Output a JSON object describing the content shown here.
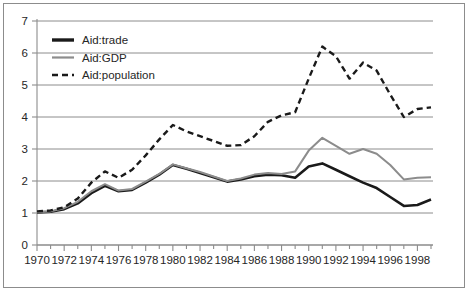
{
  "chart_data": {
    "type": "line",
    "title": "",
    "xlabel": "",
    "ylabel": "",
    "xlim": [
      1970,
      1999
    ],
    "ylim": [
      0,
      7
    ],
    "grid": true,
    "legend_position": "top-left",
    "x": [
      1970,
      1971,
      1972,
      1973,
      1974,
      1975,
      1976,
      1977,
      1978,
      1979,
      1980,
      1981,
      1982,
      1983,
      1984,
      1985,
      1986,
      1987,
      1988,
      1989,
      1990,
      1991,
      1992,
      1993,
      1994,
      1995,
      1996,
      1997,
      1998,
      1999
    ],
    "xtick_labels": [
      "1970",
      "1972",
      "1974",
      "1976",
      "1978",
      "1980",
      "1982",
      "1984",
      "1986",
      "1988",
      "1990",
      "1992",
      "1994",
      "1996",
      "1998"
    ],
    "xtick_values": [
      1970,
      1972,
      1974,
      1976,
      1978,
      1980,
      1982,
      1984,
      1986,
      1988,
      1990,
      1992,
      1994,
      1996,
      1998
    ],
    "ytick_labels": [
      "0",
      "1",
      "2",
      "3",
      "4",
      "5",
      "6",
      "7"
    ],
    "ytick_values": [
      0,
      1,
      2,
      3,
      4,
      5,
      6,
      7
    ],
    "series": [
      {
        "name": "Aid:trade",
        "color": "#1a1a1a",
        "style": "solid",
        "width": 2.6,
        "values": [
          1.02,
          1.04,
          1.12,
          1.3,
          1.62,
          1.85,
          1.68,
          1.72,
          1.95,
          2.2,
          2.5,
          2.38,
          2.25,
          2.12,
          1.98,
          2.05,
          2.15,
          2.2,
          2.18,
          2.1,
          2.45,
          2.55,
          2.35,
          2.15,
          1.95,
          1.78,
          1.5,
          1.22,
          1.25,
          1.42
        ]
      },
      {
        "name": "Aid:GDP",
        "color": "#8c8c8c",
        "style": "solid",
        "width": 2.0,
        "values": [
          1.02,
          1.05,
          1.15,
          1.35,
          1.68,
          1.9,
          1.7,
          1.75,
          1.98,
          2.22,
          2.52,
          2.4,
          2.28,
          2.14,
          2.0,
          2.08,
          2.2,
          2.25,
          2.22,
          2.3,
          2.95,
          3.35,
          3.1,
          2.85,
          3.0,
          2.85,
          2.5,
          2.05,
          2.1,
          2.12
        ]
      },
      {
        "name": "Aid:population",
        "color": "#1a1a1a",
        "style": "dashed",
        "width": 2.4,
        "values": [
          1.05,
          1.08,
          1.18,
          1.45,
          1.95,
          2.3,
          2.1,
          2.35,
          2.8,
          3.3,
          3.75,
          3.55,
          3.4,
          3.25,
          3.1,
          3.12,
          3.4,
          3.85,
          4.05,
          4.15,
          5.2,
          6.2,
          5.9,
          5.2,
          5.7,
          5.45,
          4.7,
          4.0,
          4.25,
          4.3
        ]
      }
    ],
    "legend": [
      {
        "label": "Aid:trade",
        "color": "#1a1a1a",
        "style": "solid",
        "width": 3.4
      },
      {
        "label": "Aid:GDP",
        "color": "#8c8c8c",
        "style": "solid",
        "width": 2.2
      },
      {
        "label": "Aid:population",
        "color": "#1a1a1a",
        "style": "dashed",
        "width": 2.6
      }
    ]
  },
  "axis_colors": {
    "grid": "#8c8c8c",
    "axis": "#8c8c8c",
    "tick": "#8c8c8c",
    "text": "#262626",
    "frame": "#8c8c8c"
  }
}
